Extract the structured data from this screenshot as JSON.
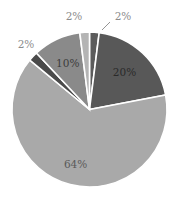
{
  "chart_data": {
    "type": "pie",
    "title": "",
    "start": "top",
    "direction": "clockwise",
    "slices": [
      {
        "label": "2%",
        "value": 2,
        "color": "#5c5c5c",
        "label_color": "#8c8c8c",
        "label_outside": true
      },
      {
        "label": "20%",
        "value": 20,
        "color": "#585858",
        "label_color": "#2a2a2a",
        "label_outside": false
      },
      {
        "label": "64%",
        "value": 64,
        "color": "#a9a9a9",
        "label_color": "#5a5a5a",
        "label_outside": false
      },
      {
        "label": "2%",
        "value": 2,
        "color": "#4a4a4a",
        "label_color": "#8c8c8c",
        "label_outside": true
      },
      {
        "label": "10%",
        "value": 10,
        "color": "#8a8a8a",
        "label_color": "#3c3c3c",
        "label_outside": false
      },
      {
        "label": "2%",
        "value": 2,
        "color": "#b4b4b4",
        "label_color": "#8c8c8c",
        "label_outside": true
      }
    ],
    "legend": "none"
  }
}
